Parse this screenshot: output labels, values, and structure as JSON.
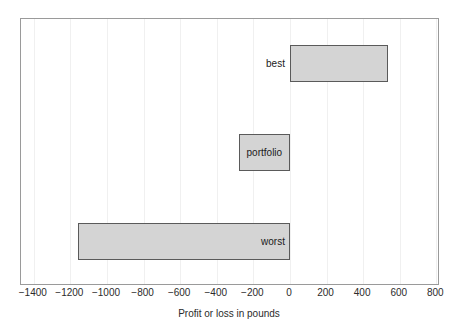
{
  "chart_data": {
    "type": "bar",
    "orientation": "horizontal",
    "title": "",
    "xlabel": "Profit or loss in pounds",
    "ylabel": "",
    "categories": [
      "best",
      "portfolio",
      "worst"
    ],
    "values": [
      535,
      -280,
      -1160
    ],
    "series": [
      {
        "name": "Profit or loss",
        "values": [
          535,
          -280,
          -1160
        ]
      }
    ],
    "bars": [
      {
        "label": "best",
        "value": 535,
        "start": 0,
        "end": 535,
        "label_position": "outside-left"
      },
      {
        "label": "portfolio",
        "value": -280,
        "start": -280,
        "end": 0,
        "label_position": "inside"
      },
      {
        "label": "worst",
        "value": -1160,
        "start": -1160,
        "end": 0,
        "label_position": "inside-right"
      }
    ],
    "xlim": [
      -1470,
      820
    ],
    "xticks": [
      -1400,
      -1200,
      -1000,
      -800,
      -600,
      -400,
      -200,
      0,
      200,
      400,
      600,
      800
    ],
    "xticklabels": [
      "−1400",
      "−1200",
      "−1000",
      "−800",
      "−600",
      "−400",
      "−200",
      "0",
      "200",
      "400",
      "600",
      "800"
    ],
    "grid": true,
    "grid_axis": "x",
    "legend": false,
    "colors": {
      "bar_fill": "#d4d4d4",
      "bar_edge": "#5a5a5a",
      "frame": "#9a9a9a",
      "gridline": "#f0f0f0",
      "text": "#2b2b2b",
      "background": "#ffffff"
    }
  }
}
